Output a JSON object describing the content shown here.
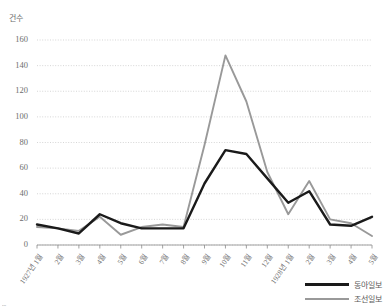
{
  "chart_data": {
    "type": "line",
    "title": "",
    "xlabel": "",
    "ylabel": "건수",
    "ylim": [
      0,
      160
    ],
    "yticks": [
      0,
      20,
      40,
      60,
      80,
      100,
      120,
      140,
      160
    ],
    "grid": true,
    "legend_position": "bottom-right",
    "categories": [
      "1927년 1월",
      "2월",
      "3월",
      "4월",
      "5월",
      "6월",
      "7월",
      "8월",
      "9월",
      "10월",
      "11월",
      "12월",
      "1928년 1월",
      "2월",
      "3월",
      "4월",
      "5월"
    ],
    "series": [
      {
        "name": "동아일보",
        "color": "#1a1a1a",
        "width": 2.4,
        "values": [
          16,
          13,
          9,
          24,
          17,
          13,
          13,
          13,
          48,
          74,
          71,
          52,
          33,
          42,
          16,
          15,
          22
        ]
      },
      {
        "name": "조선일보",
        "color": "#999999",
        "width": 1.9,
        "values": [
          14,
          13,
          11,
          22,
          8,
          14,
          16,
          14,
          78,
          148,
          112,
          57,
          24,
          50,
          20,
          17,
          7
        ]
      }
    ]
  },
  "axis": {
    "unit_label": "건수"
  },
  "legend": {
    "entries": [
      {
        "label": "동아일보"
      },
      {
        "label": "조선일보"
      }
    ]
  },
  "artifact": {
    "text": "▪▪▪"
  }
}
